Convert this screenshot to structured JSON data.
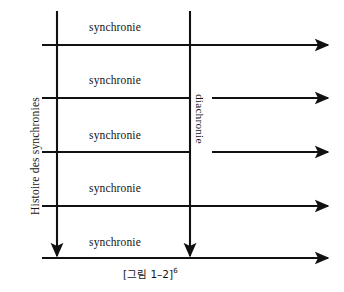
{
  "figure": {
    "caption_main": "[그림 1–2]",
    "caption_sup": "6",
    "axis_label_vertical": "Histoire des synchronies",
    "axis_label_diachronie": "diachronie",
    "line_color": "#111111",
    "background_color": "#ffffff",
    "text_color": "#141414"
  },
  "rows": [
    {
      "label": "synchronie"
    },
    {
      "label": "synchronie"
    },
    {
      "label": "synchronie"
    },
    {
      "label": "synchronie"
    },
    {
      "label": "synchronie"
    }
  ]
}
